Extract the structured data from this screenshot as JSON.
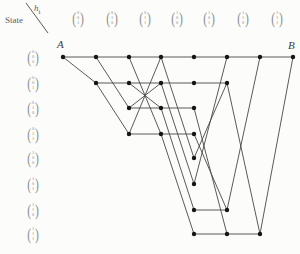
{
  "header": {
    "state_label": "State",
    "hi_label": "h",
    "hi_sub": "i",
    "columns": [
      [
        "0",
        "0",
        "1"
      ],
      [
        "0",
        "1",
        "0"
      ],
      [
        "0",
        "1",
        "1"
      ],
      [
        "1",
        "0",
        "0"
      ],
      [
        "1",
        "0",
        "1"
      ],
      [
        "1",
        "1",
        "0"
      ],
      [
        "1",
        "1",
        "1"
      ]
    ]
  },
  "states": [
    [
      "0",
      "0",
      "0"
    ],
    [
      "0",
      "0",
      "1"
    ],
    [
      "0",
      "1",
      "0"
    ],
    [
      "0",
      "1",
      "1"
    ],
    [
      "1",
      "0",
      "0"
    ],
    [
      "1",
      "0",
      "1"
    ],
    [
      "1",
      "1",
      "0"
    ],
    [
      "1",
      "1",
      "1"
    ]
  ],
  "endpoints": {
    "start": "A",
    "end": "B"
  },
  "layout": {
    "col_x": [
      63,
      96,
      129,
      161,
      194,
      227,
      260,
      293
    ],
    "row_y": [
      57,
      83,
      108,
      134,
      158,
      184,
      210,
      234
    ],
    "header_x": [
      78,
      112,
      145,
      177,
      209,
      243,
      277
    ],
    "header_y": 18,
    "state_x": 33,
    "corner_line": [
      26,
      3,
      48,
      33
    ]
  },
  "nodes": [
    [
      0,
      0
    ],
    [
      1,
      0
    ],
    [
      1,
      1
    ],
    [
      2,
      0
    ],
    [
      2,
      1
    ],
    [
      2,
      2
    ],
    [
      2,
      3
    ],
    [
      3,
      0
    ],
    [
      3,
      1
    ],
    [
      3,
      2
    ],
    [
      3,
      3
    ],
    [
      4,
      0
    ],
    [
      4,
      1
    ],
    [
      4,
      2
    ],
    [
      4,
      3
    ],
    [
      4,
      4
    ],
    [
      4,
      5
    ],
    [
      4,
      6
    ],
    [
      4,
      7
    ],
    [
      5,
      0
    ],
    [
      5,
      1
    ],
    [
      5,
      6
    ],
    [
      5,
      7
    ],
    [
      6,
      0
    ],
    [
      6,
      7
    ],
    [
      7,
      0
    ]
  ],
  "edges": [
    [
      0,
      0,
      1,
      0
    ],
    [
      0,
      0,
      1,
      1
    ],
    [
      1,
      0,
      2,
      0
    ],
    [
      1,
      0,
      2,
      2
    ],
    [
      1,
      1,
      2,
      1
    ],
    [
      1,
      1,
      2,
      3
    ],
    [
      2,
      0,
      3,
      0
    ],
    [
      2,
      0,
      3,
      3
    ],
    [
      2,
      1,
      3,
      1
    ],
    [
      2,
      1,
      3,
      2
    ],
    [
      2,
      2,
      3,
      2
    ],
    [
      2,
      2,
      3,
      1
    ],
    [
      2,
      3,
      3,
      3
    ],
    [
      2,
      3,
      3,
      0
    ],
    [
      3,
      0,
      4,
      0
    ],
    [
      3,
      0,
      4,
      4
    ],
    [
      3,
      1,
      4,
      1
    ],
    [
      3,
      1,
      4,
      5
    ],
    [
      3,
      2,
      4,
      2
    ],
    [
      3,
      2,
      4,
      6
    ],
    [
      3,
      3,
      4,
      3
    ],
    [
      3,
      3,
      4,
      7
    ],
    [
      4,
      0,
      5,
      0
    ],
    [
      4,
      5,
      5,
      0
    ],
    [
      4,
      1,
      5,
      1
    ],
    [
      4,
      4,
      5,
      1
    ],
    [
      4,
      6,
      5,
      6
    ],
    [
      4,
      3,
      5,
      6
    ],
    [
      4,
      7,
      5,
      7
    ],
    [
      4,
      2,
      5,
      7
    ],
    [
      5,
      0,
      6,
      0
    ],
    [
      5,
      6,
      6,
      0
    ],
    [
      5,
      7,
      6,
      7
    ],
    [
      5,
      1,
      6,
      7
    ],
    [
      6,
      0,
      7,
      0
    ],
    [
      6,
      7,
      7,
      0
    ]
  ],
  "colors": {
    "background": "#fcfcfb",
    "line": "#474747",
    "dot": "#151515",
    "vector_text": "#8d8d8d",
    "label_text": "#606060"
  }
}
